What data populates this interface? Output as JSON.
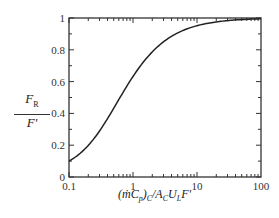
{
  "chart_data": {
    "type": "line",
    "title": "",
    "xlabel": "(ṁC_p)_C / A_C U_L F'",
    "ylabel": "F_R / F'",
    "xscale": "log",
    "xlim": [
      0.1,
      100
    ],
    "ylim": [
      0,
      1
    ],
    "x_ticks": [
      "0.1",
      "1",
      "10",
      "100"
    ],
    "y_ticks": [
      "0",
      "0.2",
      "0.4",
      "0.6",
      "0.8",
      "1"
    ],
    "grid": false,
    "legend": null,
    "series": [
      {
        "name": "F_R/F'",
        "x": [
          0.1,
          0.2,
          0.3,
          0.5,
          0.7,
          1,
          1.5,
          2,
          3,
          5,
          7,
          10,
          20,
          30,
          50,
          100
        ],
        "y": [
          0.1,
          0.2,
          0.29,
          0.43,
          0.53,
          0.63,
          0.73,
          0.79,
          0.86,
          0.91,
          0.93,
          0.95,
          0.975,
          0.983,
          0.99,
          0.995
        ]
      }
    ]
  },
  "labels": {
    "y_num": "F",
    "y_num_sub": "R",
    "y_den": "F'",
    "x_label_html": "(ṁC_p)_C / A_C U_L F'"
  }
}
